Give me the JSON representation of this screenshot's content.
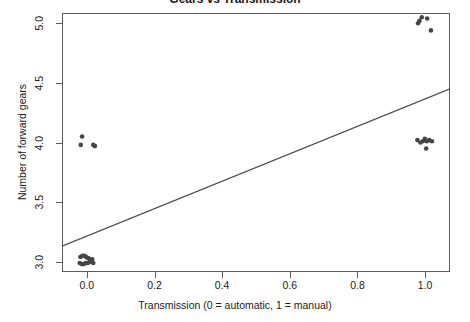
{
  "figure": {
    "title_clipped": "Gears vs Transmission",
    "background_color": "#ffffff",
    "frame_color": "#5c5c5c"
  },
  "chart_data": {
    "type": "scatter",
    "title": "Gears vs Transmission",
    "xlabel": "Transmission (0 = automatic, 1 = manual)",
    "ylabel": "Number of forward gears",
    "xlim": [
      -0.0734,
      1.0734
    ],
    "ylim": [
      2.9139,
      5.0861
    ],
    "grid": false,
    "legend": null,
    "xticks": [
      0.0,
      0.2,
      0.4,
      0.6,
      0.8,
      1.0
    ],
    "xtick_labels": [
      "0.0",
      "0.2",
      "0.4",
      "0.6",
      "0.8",
      "1.0"
    ],
    "yticks": [
      3.0,
      3.5,
      4.0,
      4.5,
      5.0
    ],
    "ytick_labels": [
      "3.0",
      "3.5",
      "4.0",
      "4.5",
      "5.0"
    ],
    "point_color": "#454545",
    "point_radius": 2.3,
    "line_color": "#4a4a4a",
    "line_width": 1.2,
    "fit_line": {
      "label": "linear fit",
      "x_start": -0.0734,
      "y_start": 3.13,
      "x_end": 1.0734,
      "y_end": 4.45
    },
    "series": [
      {
        "name": "cars",
        "note": "jittered transmission (x) vs number of forward gears (y)",
        "points": [
          {
            "x": -0.019,
            "y": 3.04
          },
          {
            "x": -0.013,
            "y": 3.05
          },
          {
            "x": -0.007,
            "y": 3.05
          },
          {
            "x": -0.002,
            "y": 3.04
          },
          {
            "x": 0.004,
            "y": 3.03
          },
          {
            "x": 0.009,
            "y": 3.02
          },
          {
            "x": -0.021,
            "y": 2.99
          },
          {
            "x": -0.015,
            "y": 2.98
          },
          {
            "x": -0.009,
            "y": 2.98
          },
          {
            "x": -0.003,
            "y": 2.99
          },
          {
            "x": 0.003,
            "y": 2.99
          },
          {
            "x": 0.01,
            "y": 3.0
          },
          {
            "x": 0.016,
            "y": 3.02
          },
          {
            "x": 0.019,
            "y": 2.99
          },
          {
            "x": -0.014,
            "y": 4.05
          },
          {
            "x": -0.018,
            "y": 3.98
          },
          {
            "x": 0.019,
            "y": 3.98
          },
          {
            "x": 0.024,
            "y": 3.97
          },
          {
            "x": 0.977,
            "y": 4.02
          },
          {
            "x": 0.986,
            "y": 4.0
          },
          {
            "x": 0.993,
            "y": 4.01
          },
          {
            "x": 0.999,
            "y": 4.03
          },
          {
            "x": 1.005,
            "y": 4.01
          },
          {
            "x": 1.012,
            "y": 4.02
          },
          {
            "x": 1.02,
            "y": 4.01
          },
          {
            "x": 1.003,
            "y": 3.95
          },
          {
            "x": 0.979,
            "y": 5.0
          },
          {
            "x": 0.983,
            "y": 5.02
          },
          {
            "x": 0.99,
            "y": 5.05
          },
          {
            "x": 1.006,
            "y": 5.04
          },
          {
            "x": 1.017,
            "y": 4.94
          }
        ]
      }
    ]
  }
}
